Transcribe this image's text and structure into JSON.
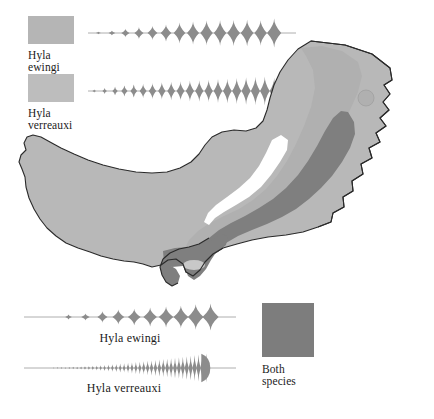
{
  "figure": {
    "type": "distribution-map-with-call-waveforms"
  },
  "legend": {
    "ewingi": {
      "genus": "Hyla",
      "species": "ewingi",
      "swatch_color": "#b5b5b5",
      "swatch_name": "hyla-ewingi-range-swatch"
    },
    "verreauxi": {
      "genus": "Hyla",
      "species": "verreauxi",
      "swatch_color": "#bdbdbd",
      "swatch_name": "hyla-verreauxi-range-swatch"
    },
    "both": {
      "line1": "Both",
      "line2": "species",
      "swatch_color": "#7d7d7d",
      "swatch_name": "both-species-range-swatch"
    }
  },
  "captions": {
    "bottom_ewingi": "Hyla ewingi",
    "bottom_verreauxi": "Hyla verreauxi"
  },
  "colors": {
    "range_light": "#b8b8b8",
    "range_mid": "#b0b0b0",
    "range_overlap_dark": "#7f7f7f",
    "map_outline": "#2a2a2a",
    "waveform_fill": "#8c8c8c",
    "waveform_axis": "#9a9a9a",
    "background": "#ffffff",
    "text": "#1b1b1b"
  },
  "chart_data": [
    {
      "type": "waveform",
      "name": "sympatric-call-hyla-ewingi",
      "title": "Hyla ewingi call (sympatric / top panel)",
      "position": "top",
      "axis": "horizontal baseline",
      "pulse_count": 14,
      "pulse_centers_pct": [
        5,
        11.5,
        18,
        24.5,
        31,
        37.5,
        44,
        50.5,
        57,
        63.5,
        70,
        76.5,
        83,
        89.5
      ],
      "pulse_amplitudes": [
        0.08,
        0.16,
        0.3,
        0.42,
        0.48,
        0.58,
        0.72,
        0.8,
        0.86,
        0.88,
        0.9,
        0.92,
        0.88,
        1.0
      ],
      "pulse_widths_pct": [
        1.2,
        1.6,
        2.0,
        2.2,
        2.4,
        2.6,
        2.8,
        2.9,
        3.0,
        3.0,
        3.1,
        3.1,
        3.0,
        3.4
      ],
      "trailing_tail": true
    },
    {
      "type": "waveform",
      "name": "sympatric-call-hyla-verreauxi",
      "title": "Hyla verreauxi call (sympatric / top panel)",
      "position": "top",
      "axis": "horizontal baseline",
      "pulse_count": 21,
      "pulse_centers_pct": [
        3,
        8,
        13,
        17.5,
        22,
        26.5,
        31,
        35.5,
        40,
        44.5,
        49,
        53.5,
        58,
        62.5,
        67,
        71.5,
        76,
        80.5,
        85,
        89.5,
        94
      ],
      "pulse_amplitudes": [
        0.1,
        0.2,
        0.3,
        0.38,
        0.44,
        0.5,
        0.56,
        0.6,
        0.64,
        0.68,
        0.72,
        0.74,
        0.78,
        0.82,
        0.84,
        0.9,
        0.94,
        0.98,
        1.0,
        0.92,
        0.8
      ],
      "pulse_widths_pct": [
        0.9,
        1.1,
        1.3,
        1.5,
        1.6,
        1.7,
        1.8,
        1.8,
        1.9,
        1.9,
        2.0,
        2.0,
        2.0,
        2.1,
        2.1,
        2.2,
        2.2,
        2.2,
        2.3,
        2.2,
        2.1
      ],
      "trailing_tail": true
    },
    {
      "type": "waveform",
      "name": "allopatric-call-hyla-ewingi",
      "title": "Hyla ewingi",
      "position": "bottom",
      "axis": "horizontal baseline",
      "pulse_count": 10,
      "pulse_centers_pct": [
        21,
        29,
        37,
        44.5,
        52,
        59.5,
        67,
        74,
        81,
        88
      ],
      "pulse_amplitudes": [
        0.18,
        0.26,
        0.42,
        0.56,
        0.62,
        0.7,
        0.78,
        0.84,
        0.94,
        1.0
      ],
      "pulse_widths_pct": [
        1.6,
        2.0,
        2.4,
        2.8,
        3.0,
        3.2,
        3.4,
        3.5,
        3.7,
        3.8
      ],
      "trailing_tail": true
    },
    {
      "type": "waveform",
      "name": "allopatric-call-hyla-verreauxi",
      "title": "Hyla verreauxi",
      "position": "bottom",
      "axis": "horizontal baseline",
      "pulse_count": 40,
      "envelope_start_pct": 14,
      "envelope_end_pct": 86,
      "envelope_shape": "exponential-rise-to-abrupt-cutoff",
      "max_amplitude_at_pct": 84,
      "trailing_tail": true
    }
  ]
}
